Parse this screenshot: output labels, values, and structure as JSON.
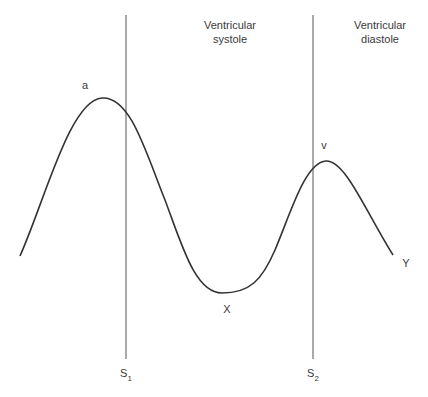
{
  "diagram": {
    "type": "jugular venous pressure waveform",
    "phases": [
      {
        "label_line1": "Ventricular",
        "label_line2": "systole"
      },
      {
        "label_line1": "Ventricular",
        "label_line2": "diastole"
      }
    ],
    "markers": [
      {
        "label": "S",
        "subscript": "1"
      },
      {
        "label": "S",
        "subscript": "2"
      }
    ],
    "points": {
      "a": "a",
      "x": "X",
      "v": "v",
      "y": "Y"
    },
    "colors": {
      "curve": "#333333",
      "marker_line": "#555555",
      "text": "#3a3a3a"
    }
  }
}
